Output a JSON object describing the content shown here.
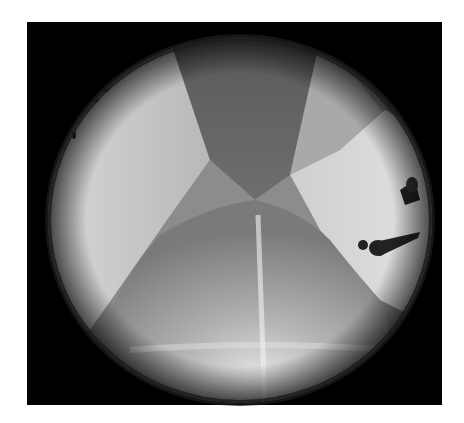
{
  "image": {
    "description": "Grayscale fisheye (circular) photograph of a room interior viewed from above; floor panel at bottom, wall panels at left and right, darker ceiling panel at top, small figures near right edge",
    "kind": "fisheye-photograph",
    "color_mode": "grayscale",
    "frame_color": "#000000",
    "background_color": "#ffffff"
  }
}
